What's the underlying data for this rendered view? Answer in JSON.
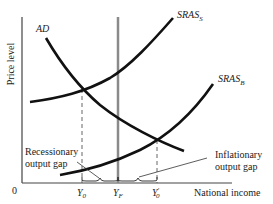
{
  "diagram": {
    "type": "AD-SRAS economic diagram",
    "axes": {
      "y_label": "Price level",
      "x_label": "National income",
      "origin_label": "0"
    },
    "curves": [
      {
        "name": "AD",
        "label": "AD",
        "label_sub": ""
      },
      {
        "name": "SRAS_S",
        "label": "SRAS",
        "label_sub": "S"
      },
      {
        "name": "SRAS_B",
        "label": "SRAS",
        "label_sub": "B"
      },
      {
        "name": "LRAS",
        "label": "",
        "label_sub": "",
        "note": "vertical line at Y_F"
      }
    ],
    "x_ticks": [
      {
        "label": "Y",
        "sub": "0",
        "prime": ""
      },
      {
        "label": "Y",
        "sub": "F",
        "prime": ""
      },
      {
        "label": "Y",
        "sub": "0",
        "prime": "′"
      }
    ],
    "annotations": {
      "recessionary_line1": "Recessionary",
      "recessionary_line2": "output gap",
      "inflationary_line1": "Inflationary",
      "inflationary_line2": "output gap"
    },
    "colors": {
      "curve": "#111111",
      "lras": "#8a8a8a",
      "axis": "#444444",
      "dashed": "#555555"
    }
  }
}
